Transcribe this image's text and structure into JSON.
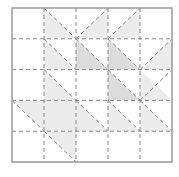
{
  "diagram": {
    "type": "quilt-block-grid",
    "grid": {
      "cols": 5,
      "rows": 5
    },
    "colors": {
      "border": "#9a9a9a",
      "dash": "#8a8a8a",
      "light_fill": "#ececec",
      "dark_fill": "#dcdcdc",
      "background": "#ffffff"
    },
    "shaded_triangles": [
      {
        "col": 1,
        "row": 0,
        "corner": "bl",
        "shade": "light"
      },
      {
        "col": 2,
        "row": 0,
        "corner": "br",
        "shade": "light"
      },
      {
        "col": 3,
        "row": 0,
        "corner": "br",
        "shade": "light"
      },
      {
        "col": 1,
        "row": 1,
        "corner": "bl",
        "shade": "light"
      },
      {
        "col": 2,
        "row": 1,
        "corner": "bl",
        "shade": "dark"
      },
      {
        "col": 3,
        "row": 1,
        "corner": "bl",
        "shade": "dark"
      },
      {
        "col": 4,
        "row": 1,
        "corner": "br",
        "shade": "light"
      },
      {
        "col": 1,
        "row": 2,
        "corner": "bl",
        "shade": "light"
      },
      {
        "col": 3,
        "row": 2,
        "corner": "bl",
        "shade": "dark"
      },
      {
        "col": 4,
        "row": 2,
        "corner": "bl",
        "shade": "light"
      },
      {
        "col": 0,
        "row": 3,
        "corner": "tr",
        "shade": "light"
      },
      {
        "col": 1,
        "row": 3,
        "corner": "full",
        "shade": "light"
      },
      {
        "col": 2,
        "row": 3,
        "corner": "bl",
        "shade": "light"
      },
      {
        "col": 3,
        "row": 3,
        "corner": "bl",
        "shade": "light"
      },
      {
        "col": 4,
        "row": 3,
        "corner": "bl",
        "shade": "light"
      },
      {
        "col": 1,
        "row": 4,
        "corner": "tr",
        "shade": "light"
      }
    ],
    "diagonals": [
      {
        "col": 1,
        "row": 0,
        "dir": "tl-br"
      },
      {
        "col": 2,
        "row": 0,
        "dir": "bl-tr"
      },
      {
        "col": 3,
        "row": 0,
        "dir": "bl-tr"
      },
      {
        "col": 1,
        "row": 1,
        "dir": "tl-br"
      },
      {
        "col": 2,
        "row": 1,
        "dir": "tl-br"
      },
      {
        "col": 3,
        "row": 1,
        "dir": "tl-br"
      },
      {
        "col": 4,
        "row": 1,
        "dir": "bl-tr"
      },
      {
        "col": 1,
        "row": 2,
        "dir": "tl-br"
      },
      {
        "col": 3,
        "row": 2,
        "dir": "tl-br"
      },
      {
        "col": 4,
        "row": 2,
        "dir": "bl-tr"
      },
      {
        "col": 0,
        "row": 3,
        "dir": "tl-br"
      },
      {
        "col": 2,
        "row": 3,
        "dir": "tl-br"
      },
      {
        "col": 3,
        "row": 3,
        "dir": "tl-br"
      },
      {
        "col": 4,
        "row": 3,
        "dir": "tl-br"
      },
      {
        "col": 1,
        "row": 4,
        "dir": "tl-br"
      }
    ]
  }
}
